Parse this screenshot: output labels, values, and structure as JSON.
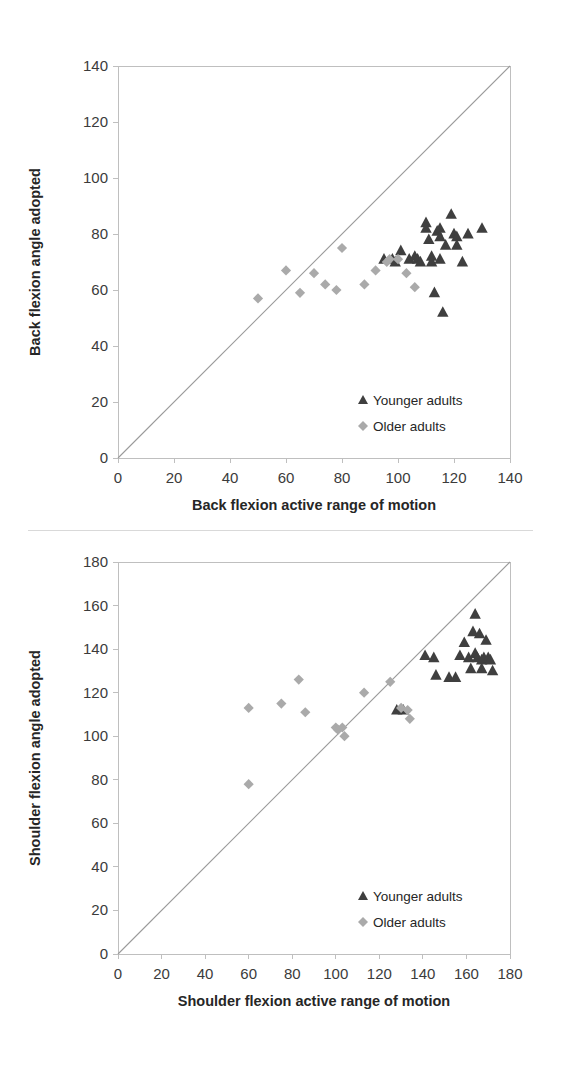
{
  "figure": {
    "panels": [
      "back-flexion",
      "shoulder-flexion"
    ]
  },
  "chart_data": [
    {
      "id": "back-flexion",
      "type": "scatter",
      "title": "",
      "xlabel": "Back flexion active range of motion",
      "ylabel": "Back flexion angle adopted",
      "xlim": [
        0,
        140
      ],
      "ylim": [
        0,
        140
      ],
      "xticks": [
        0,
        20,
        40,
        60,
        80,
        100,
        120,
        140
      ],
      "yticks": [
        0,
        20,
        40,
        60,
        80,
        100,
        120,
        140
      ],
      "grid": false,
      "legend_position": "bottom-right",
      "reference_line": {
        "name": "identity-line",
        "from": [
          0,
          0
        ],
        "to": [
          140,
          140
        ],
        "color": "#9a9a9a"
      },
      "series": [
        {
          "name": "Younger adults",
          "marker": "triangle",
          "color": "#3f3f3f",
          "points": [
            [
              95,
              71
            ],
            [
              98,
              71
            ],
            [
              99,
              70
            ],
            [
              101,
              74
            ],
            [
              104,
              71
            ],
            [
              106,
              72
            ],
            [
              107,
              71
            ],
            [
              108,
              70
            ],
            [
              110,
              84
            ],
            [
              110,
              82
            ],
            [
              111,
              78
            ],
            [
              112,
              72
            ],
            [
              112,
              70
            ],
            [
              113,
              59
            ],
            [
              114,
              81
            ],
            [
              115,
              82
            ],
            [
              115,
              79
            ],
            [
              115,
              71
            ],
            [
              116,
              52
            ],
            [
              117,
              76
            ],
            [
              119,
              87
            ],
            [
              120,
              80
            ],
            [
              121,
              79
            ],
            [
              121,
              76
            ],
            [
              123,
              70
            ],
            [
              125,
              80
            ],
            [
              130,
              82
            ]
          ]
        },
        {
          "name": "Older adults",
          "marker": "diamond",
          "color": "#aaaaaa",
          "points": [
            [
              50,
              57
            ],
            [
              60,
              67
            ],
            [
              65,
              59
            ],
            [
              70,
              66
            ],
            [
              74,
              62
            ],
            [
              78,
              60
            ],
            [
              80,
              75
            ],
            [
              88,
              62
            ],
            [
              92,
              67
            ],
            [
              96,
              70
            ],
            [
              97,
              71
            ],
            [
              100,
              71
            ],
            [
              103,
              66
            ],
            [
              106,
              61
            ]
          ]
        }
      ]
    },
    {
      "id": "shoulder-flexion",
      "type": "scatter",
      "title": "",
      "xlabel": "Shoulder flexion active range of motion",
      "ylabel": "Shoulder flexion angle adopted",
      "xlim": [
        0,
        180
      ],
      "ylim": [
        0,
        180
      ],
      "xticks": [
        0,
        20,
        40,
        60,
        80,
        100,
        120,
        140,
        160,
        180
      ],
      "yticks": [
        0,
        20,
        40,
        60,
        80,
        100,
        120,
        140,
        160,
        180
      ],
      "grid": false,
      "legend_position": "bottom-right",
      "reference_line": {
        "name": "identity-line",
        "from": [
          0,
          0
        ],
        "to": [
          180,
          180
        ],
        "color": "#9a9a9a"
      },
      "series": [
        {
          "name": "Younger adults",
          "marker": "triangle",
          "color": "#3f3f3f",
          "points": [
            [
              128,
              112
            ],
            [
              131,
              112
            ],
            [
              141,
              137
            ],
            [
              145,
              136
            ],
            [
              146,
              128
            ],
            [
              152,
              127
            ],
            [
              155,
              127
            ],
            [
              157,
              137
            ],
            [
              159,
              143
            ],
            [
              161,
              136
            ],
            [
              162,
              131
            ],
            [
              163,
              148
            ],
            [
              164,
              156
            ],
            [
              164,
              138
            ],
            [
              165,
              136
            ],
            [
              166,
              147
            ],
            [
              167,
              135
            ],
            [
              167,
              131
            ],
            [
              168,
              136
            ],
            [
              169,
              144
            ],
            [
              170,
              136
            ],
            [
              171,
              135
            ],
            [
              172,
              130
            ]
          ]
        },
        {
          "name": "Older adults",
          "marker": "diamond",
          "color": "#aaaaaa",
          "points": [
            [
              60,
              78
            ],
            [
              60,
              113
            ],
            [
              75,
              115
            ],
            [
              83,
              126
            ],
            [
              86,
              111
            ],
            [
              100,
              104
            ],
            [
              101,
              103
            ],
            [
              103,
              104
            ],
            [
              104,
              100
            ],
            [
              113,
              120
            ],
            [
              125,
              125
            ],
            [
              130,
              113
            ],
            [
              133,
              112
            ],
            [
              134,
              108
            ]
          ]
        }
      ]
    }
  ],
  "legend": {
    "younger_label": "Younger adults",
    "older_label": "Older adults"
  },
  "colors": {
    "younger": "#3f3f3f",
    "older": "#aaaaaa",
    "axis": "#bfbfbf",
    "reference_line": "#9a9a9a",
    "text": "#3b3b3b"
  }
}
